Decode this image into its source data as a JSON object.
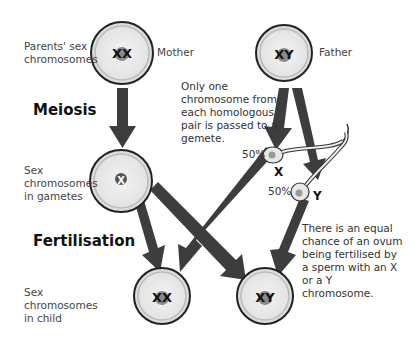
{
  "labels": {
    "parents_row": "Parents' sex chromosomes",
    "gametes_row": "Sex chromosomes in gametes",
    "child_row": "Sex chromosomes in child",
    "meiosis": "Meiosis",
    "fertilisation": "Fertilisation",
    "mother": "Mother",
    "father": "Father"
  },
  "cells": {
    "mother": "XX",
    "father": "XY",
    "ovum": "X",
    "child_female": "XX",
    "child_male": "XY"
  },
  "sperm": {
    "x": {
      "percent": "50%",
      "label": "X"
    },
    "y": {
      "percent": "50%",
      "label": "Y"
    }
  },
  "notes": {
    "meiosis_note": "Only one chromosome from each homologous pair is passed to a gemete.",
    "fertilisation_note": "There is an equal chance of an ovum being fertilised by a sperm with an X or a Y chromosome."
  },
  "colors": {
    "arrow": "#3d3d3d",
    "cell_fill": "#e6e6e6",
    "cell_border": "#222222",
    "nucleus": "#8a8a8a"
  }
}
